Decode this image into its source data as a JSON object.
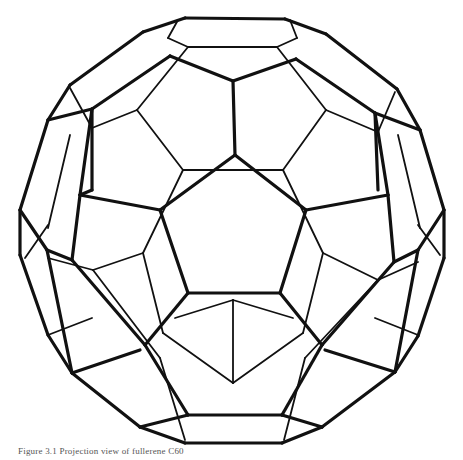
{
  "figure": {
    "caption": "Figure 3.1  Projection view of fullerene C60",
    "stroke_color": "#111111",
    "background_color": "#ffffff"
  }
}
